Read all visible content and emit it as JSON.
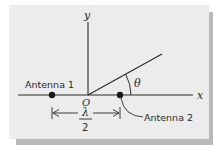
{
  "diagram": {
    "axes": {
      "x_label": "x",
      "y_label": "y",
      "origin_label": "O"
    },
    "antennas": [
      {
        "label": "Antenna 1",
        "position": "left of origin on x-axis"
      },
      {
        "label": "Antenna 2",
        "position": "right of origin on x-axis"
      }
    ],
    "angle_label": "θ",
    "spacing": {
      "numerator": "λ",
      "denominator": "2",
      "description": "distance between antennas"
    },
    "colors": {
      "background": "#ececec",
      "shadow": "#b9b9b9",
      "ink": "#2a2a2a"
    }
  }
}
